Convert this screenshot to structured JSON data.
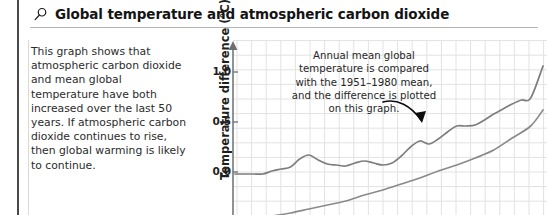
{
  "header": {
    "icon": "magnifier-icon",
    "title": "Global temperature and atmospheric carbon dioxide"
  },
  "intro": {
    "text": "This graph shows that atmospheric carbon dioxide and mean global temperature have both increased over the last 50 years. If atmospheric carbon dioxide continues to rise, then global warming is likely to continue."
  },
  "chart_data": {
    "type": "line",
    "title": "Global temperature and atmospheric carbon dioxide",
    "xlabel": "",
    "ylabel": "Temperature difference (°C)",
    "ylim": [
      -0.6,
      1.3
    ],
    "yticks": [
      1.0,
      0.5,
      0.0,
      -0.5
    ],
    "ytick_labels": [
      "1.0",
      "0.5",
      "0.0",
      "-0.5"
    ],
    "grid": true,
    "legend": "none",
    "annotation": "Annual mean global temperature is compared with the 1951–1980 mean, and the difference is plotted on this graph.",
    "annotation_target": "upper-temperature-curve",
    "series": [
      {
        "name": "Mean global temperature difference",
        "color": "#7d7d7d",
        "x": [
          0,
          3,
          6,
          9,
          12,
          15,
          18,
          21,
          24,
          27,
          30,
          33,
          36,
          39,
          42,
          45,
          48,
          51,
          54,
          57,
          60,
          63,
          66,
          69,
          72,
          75,
          78,
          81,
          84,
          87,
          90,
          93,
          96,
          100
        ],
        "y": [
          -0.02,
          -0.02,
          -0.02,
          -0.02,
          0.01,
          0.03,
          0.05,
          0.13,
          0.17,
          0.12,
          0.08,
          0.07,
          0.06,
          0.09,
          0.11,
          0.09,
          0.07,
          0.09,
          0.16,
          0.25,
          0.31,
          0.28,
          0.33,
          0.4,
          0.46,
          0.46,
          0.47,
          0.52,
          0.58,
          0.63,
          0.68,
          0.72,
          0.74,
          1.06
        ]
      },
      {
        "name": "Atmospheric carbon dioxide",
        "color": "#8a8a8a",
        "x": [
          6,
          12,
          18,
          24,
          30,
          36,
          42,
          48,
          54,
          60,
          66,
          72,
          78,
          84,
          90,
          96,
          100
        ],
        "y": [
          -0.47,
          -0.44,
          -0.41,
          -0.37,
          -0.33,
          -0.29,
          -0.23,
          -0.18,
          -0.12,
          -0.06,
          0.01,
          0.07,
          0.14,
          0.22,
          0.34,
          0.46,
          0.62
        ]
      }
    ]
  }
}
